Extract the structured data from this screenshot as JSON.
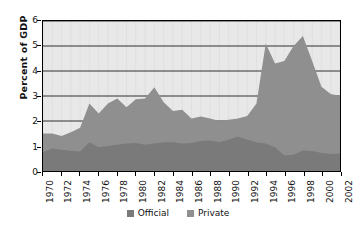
{
  "chart_data": {
    "type": "area",
    "stacked": true,
    "title": "",
    "xlabel": "",
    "ylabel": "Percent of GDP",
    "ylim": [
      0,
      6
    ],
    "yticks": [
      0,
      1,
      2,
      3,
      4,
      5,
      6
    ],
    "ytick_labels": [
      "0",
      "1",
      "2",
      "3",
      "4",
      "5",
      "6"
    ],
    "xlim": [
      1970,
      2002
    ],
    "grid": true,
    "grid_axis": "y",
    "legend_position": "bottom-center",
    "plot_background": "#e8e8e8",
    "x": [
      1970,
      1971,
      1972,
      1973,
      1974,
      1975,
      1976,
      1977,
      1978,
      1979,
      1980,
      1981,
      1982,
      1983,
      1984,
      1985,
      1986,
      1987,
      1988,
      1989,
      1990,
      1991,
      1992,
      1993,
      1994,
      1995,
      1996,
      1997,
      1998,
      1999,
      2000,
      2001,
      2002
    ],
    "xticks": [
      1970,
      1972,
      1974,
      1976,
      1978,
      1980,
      1982,
      1984,
      1986,
      1988,
      1990,
      1992,
      1994,
      1996,
      1998,
      2000,
      2002
    ],
    "xtick_labels": [
      "1970",
      "1972",
      "1974",
      "1976",
      "1978",
      "1980",
      "1982",
      "1984",
      "1986",
      "1988",
      "1990",
      "1992",
      "1994",
      "1996",
      "1998",
      "2000",
      "2002"
    ],
    "series": [
      {
        "name": "Official",
        "color": "#7a7a7a",
        "values": [
          0.75,
          0.9,
          0.85,
          0.8,
          0.78,
          1.15,
          0.95,
          1.0,
          1.05,
          1.1,
          1.12,
          1.05,
          1.1,
          1.15,
          1.15,
          1.1,
          1.12,
          1.2,
          1.22,
          1.15,
          1.25,
          1.38,
          1.25,
          1.15,
          1.1,
          0.95,
          0.62,
          0.65,
          0.82,
          0.8,
          0.72,
          0.68,
          0.7
        ]
      },
      {
        "name": "Private",
        "color": "#8f8f8f",
        "values": [
          0.75,
          0.6,
          0.55,
          0.75,
          0.95,
          1.55,
          1.35,
          1.7,
          1.85,
          1.45,
          1.75,
          1.85,
          2.25,
          1.6,
          1.25,
          1.35,
          0.98,
          0.98,
          0.88,
          0.85,
          0.8,
          0.72,
          0.95,
          1.55,
          4.0,
          3.35,
          3.78,
          4.35,
          4.58,
          3.6,
          2.65,
          2.4,
          2.3
        ]
      }
    ],
    "totals": [
      1.5,
      1.5,
      1.4,
      1.55,
      1.73,
      2.7,
      2.3,
      2.7,
      2.9,
      2.55,
      2.87,
      2.9,
      3.35,
      2.75,
      2.4,
      2.45,
      2.1,
      2.18,
      2.1,
      2.0,
      2.05,
      2.1,
      2.2,
      2.7,
      5.1,
      4.3,
      4.4,
      5.0,
      5.4,
      4.4,
      3.37,
      3.08,
      3.0
    ]
  },
  "legend": {
    "items": [
      {
        "label": "Official",
        "color": "#7a7a7a"
      },
      {
        "label": "Private",
        "color": "#8f8f8f"
      }
    ]
  },
  "axis": {
    "y_title": "Percent of GDP"
  }
}
